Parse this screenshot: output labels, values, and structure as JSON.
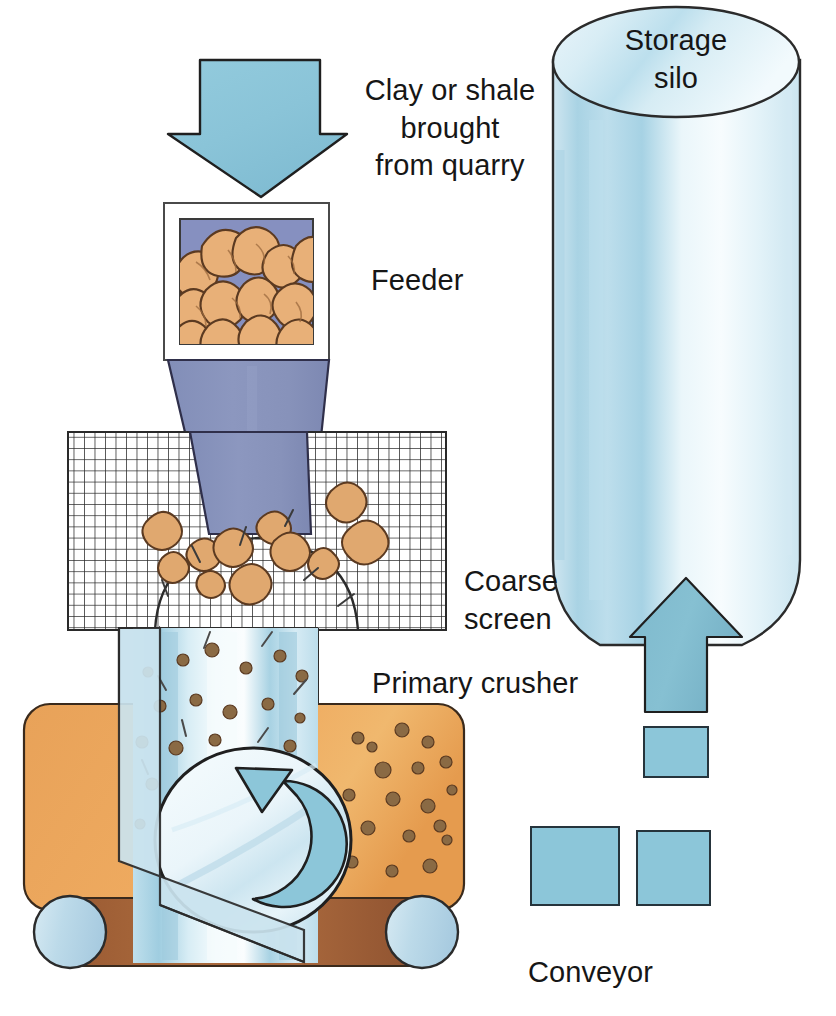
{
  "diagram": {
    "background_color": "#ffffff"
  },
  "labels": {
    "intake": "Clay or shale\nbrought\nfrom quarry",
    "feeder": "Feeder",
    "coarse_screen": "Coarse\nscreen",
    "primary_crusher": "Primary crusher",
    "conveyor": "Conveyor",
    "storage_silo": "Storage\nsilo"
  },
  "colors": {
    "arrow_blue": "#8CC6D9",
    "arrow_blue_dark": "#79B4C9",
    "hopper_blue_purple": "#8994BC",
    "rock_tan": "#E8B078",
    "rock_outline": "#5B3A21",
    "conveyor_orange": "#EDA458",
    "belt_brown": "#A8663C",
    "roller_blue": "#BBD8E8",
    "silo_light": "#E9F4F9",
    "silo_mid": "#B7DCE9",
    "outline": "#1b1b1b",
    "text": "#161616",
    "screen_line": "#2a2a2a"
  },
  "elements": {
    "intake_arrow": {
      "name": "downward feed arrow",
      "direction": "down"
    },
    "feeder_box": {
      "name": "feeder bin containing quarried lumps",
      "fill": "#8994BC"
    },
    "hopper": {
      "name": "tapered hopper chute",
      "fill": "#8994BC"
    },
    "coarse_screen": {
      "name": "grid mesh screen",
      "columns": 40,
      "rows": 18
    },
    "primary_crusher": {
      "name": "primary crusher drum",
      "rotation": "counter-clockwise"
    },
    "conveyor": {
      "name": "belt conveyor with two rollers",
      "rollers": 2
    },
    "storage_silo": {
      "name": "cylindrical storage silo",
      "shape": "cylinder with elliptical top and rounded base"
    },
    "return_arrow": {
      "name": "upward arrow feeding silo",
      "direction": "up"
    },
    "dashed_path": {
      "name": "dashed square-block conveyor path",
      "block_count": 4
    }
  }
}
